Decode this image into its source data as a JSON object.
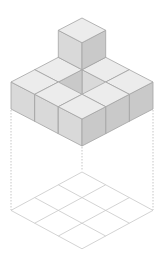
{
  "colors": {
    "background": "#ffffff",
    "top_face": "#ececec",
    "left_face": "#d9d9d9",
    "right_face": "#c9c9c9",
    "edge": "#a3a3a3",
    "hole_left": "#b6b6b6",
    "hole_right": "#cbcbcb",
    "grid_line": "#c8c8c8",
    "dashed_line": "#b8b8b8"
  },
  "projection": {
    "origin_x": 82,
    "origin_y": 72,
    "dx": 23.67,
    "dy": 12.33,
    "height": 27,
    "grid_origin_y": 172,
    "grid_dy": 12.8
  },
  "grid": {
    "rows": 3,
    "cols": 3
  },
  "cubes": [
    {
      "i": 0,
      "j": 0,
      "k": 0
    },
    {
      "i": 1,
      "j": 0,
      "k": 0
    },
    {
      "i": 0,
      "j": 1,
      "k": 0
    },
    {
      "i": 2,
      "j": 0,
      "k": 0
    },
    {
      "i": 0,
      "j": 2,
      "k": 0
    },
    {
      "i": 2,
      "j": 1,
      "k": 0
    },
    {
      "i": 1,
      "j": 2,
      "k": 0
    },
    {
      "i": 2,
      "j": 2,
      "k": 0
    },
    {
      "i": 0,
      "j": 0,
      "k": 1
    }
  ],
  "hole": {
    "i": 1,
    "j": 1
  },
  "dashed_drops": [
    {
      "x": 11,
      "y1": 110,
      "y2": 210
    },
    {
      "x": 82,
      "y1": 147,
      "y2": 171
    },
    {
      "x": 153,
      "y1": 110,
      "y2": 210
    }
  ]
}
